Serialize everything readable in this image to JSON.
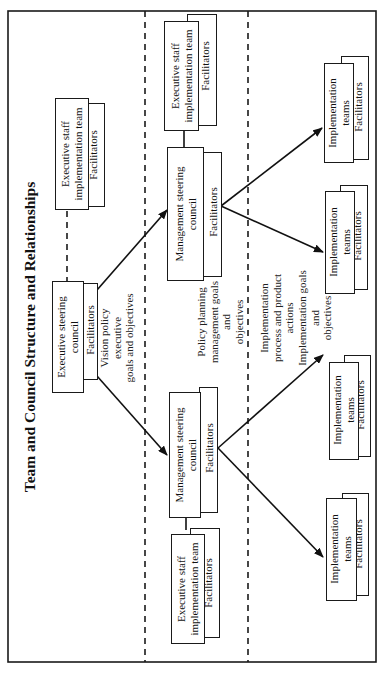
{
  "diagram": {
    "title": "Team and Council Structure and Relationships",
    "orientation": "rotated 90deg counter-clockwise",
    "bands": [
      {
        "id": "executive",
        "note": [
          "Vision policy",
          "executive",
          "goals and objectives"
        ]
      },
      {
        "id": "management",
        "note": [
          "Policy planning",
          "management goals",
          "and",
          "objectives"
        ]
      },
      {
        "id": "implementation",
        "note": [
          "Implementation",
          "process and product",
          "actions",
          "Implementation goals",
          "and",
          "objectives"
        ]
      }
    ],
    "nodes": {
      "exec_staff_team_top": {
        "line1": "Executive staff",
        "line2": "implementation team",
        "facilitators": "Facilitators"
      },
      "exec_steering_council": {
        "line1": "Executive steering",
        "line2": "council",
        "facilitators": "Facilitators"
      },
      "mgmt_council_upper": {
        "line1": "Management steering",
        "line2": "council",
        "facilitators": "Facilitators"
      },
      "mgmt_council_lower": {
        "line1": "Management steering",
        "line2": "council",
        "facilitators": "Facilitators"
      },
      "exec_staff_team_upper": {
        "line1": "Executive staff",
        "line2": "implementation team",
        "facilitators": "Facilitators"
      },
      "exec_staff_team_lower": {
        "line1": "Executive staff",
        "line2": "implementation team",
        "facilitators": "Facilitators"
      },
      "impl_team_1": {
        "line1": "Implementation",
        "line2": "teams",
        "facilitators": "Facilitators"
      },
      "impl_team_2": {
        "line1": "Implementation",
        "line2": "teams",
        "facilitators": "Facilitators"
      },
      "impl_team_3": {
        "line1": "Implementation",
        "line2": "teams",
        "facilitators": "Facilitators"
      },
      "impl_team_4": {
        "line1": "Implementation",
        "line2": "teams",
        "facilitators": "Facilitators"
      }
    },
    "edges": [
      {
        "from": "exec_steering_council",
        "to": "mgmt_council_upper",
        "style": "arrow"
      },
      {
        "from": "exec_steering_council",
        "to": "mgmt_council_lower",
        "style": "arrow"
      },
      {
        "from": "exec_steering_council",
        "to": "exec_staff_team_top",
        "style": "dashed"
      },
      {
        "from": "mgmt_council_upper",
        "to": "exec_staff_team_upper",
        "style": "solid"
      },
      {
        "from": "mgmt_council_lower",
        "to": "exec_staff_team_lower",
        "style": "solid"
      },
      {
        "from": "mgmt_council_upper",
        "to": "impl_team_1",
        "style": "arrow"
      },
      {
        "from": "mgmt_council_upper",
        "to": "impl_team_2",
        "style": "arrow"
      },
      {
        "from": "mgmt_council_lower",
        "to": "impl_team_3",
        "style": "arrow"
      },
      {
        "from": "mgmt_council_lower",
        "to": "impl_team_4",
        "style": "arrow"
      }
    ]
  }
}
